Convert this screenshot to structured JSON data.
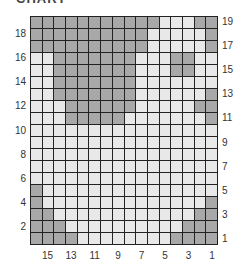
{
  "title": "CHART",
  "colors": {
    "dark": "#a8a8a8",
    "light": "#e8e8e8",
    "grid_line": "#222222"
  },
  "grid": {
    "columns": 16,
    "rows": 19,
    "row_labels_left": [
      "18",
      "16",
      "14",
      "12",
      "10",
      "8",
      "6",
      "4",
      "2"
    ],
    "row_labels_right": [
      "19",
      "17",
      "15",
      "13",
      "11",
      "9",
      "7",
      "5",
      "3",
      "1"
    ],
    "column_labels": [
      "15",
      "13",
      "11",
      "9",
      "7",
      "5",
      "3",
      "1"
    ],
    "rows_top_to_bottom": [
      "DDDDDDDDDDDLLLDD",
      "DDDDDDDDDDLLLLLD",
      "DDDDDDDDDDLLLLLD",
      "LLDDDDDDDLLLDDLL",
      "LLDDDDDDDLLLDDLL",
      "LLDDDDDDDLLLLLLL",
      "LLDDDDDDDLLLLLLD",
      "LLLDDDDDDLLLLLDD",
      "LLLDDDDDLLLLLLLD",
      "LLLLLLLLLLLLLLLL",
      "LLLLLLLLLLLLLLLL",
      "LLLLLLLLLLLLLLLL",
      "LLLLLLLLLLLLLLLL",
      "LLLLLLLLLLLLLLLL",
      "DLLLLLLLLLLLLLLL",
      "DLLLLLLLLLLLLLLD",
      "DDLLLLLLLLLLLLDD",
      "DDDLLLLLLLLLLDDD",
      "DDDDLLLLLLLLDDDD"
    ]
  }
}
